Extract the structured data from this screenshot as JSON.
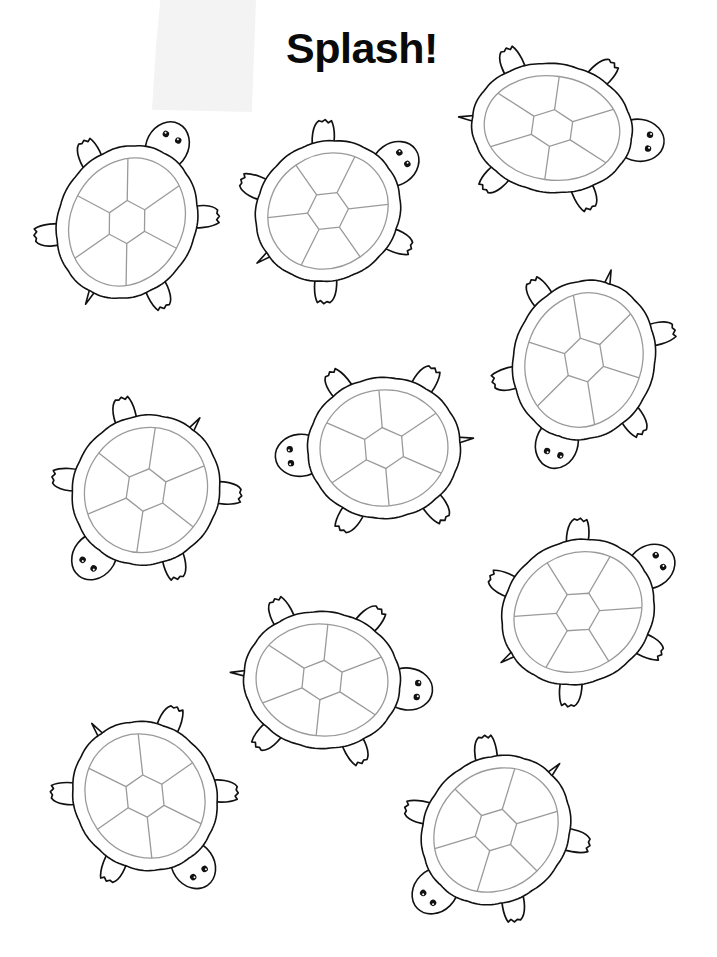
{
  "page": {
    "title": "Splash!",
    "background": "#ffffff",
    "line_color": "#111111",
    "scute_color": "#9a9a9a"
  },
  "illustration": {
    "subject": "turtle coloring page",
    "turtle_count": 10,
    "turtles": [
      {
        "id": 1,
        "cx": 127,
        "cy": 222,
        "rx": 60,
        "ry": 70,
        "heading": -62
      },
      {
        "id": 2,
        "cx": 328,
        "cy": 211,
        "rx": 60,
        "ry": 66,
        "heading": -35
      },
      {
        "id": 3,
        "cx": 552,
        "cy": 128,
        "rx": 72,
        "ry": 56,
        "heading": 8
      },
      {
        "id": 4,
        "cx": 584,
        "cy": 360,
        "rx": 62,
        "ry": 72,
        "heading": 108
      },
      {
        "id": 5,
        "cx": 146,
        "cy": 490,
        "rx": 64,
        "ry": 68,
        "heading": 128
      },
      {
        "id": 6,
        "cx": 384,
        "cy": 448,
        "rx": 68,
        "ry": 62,
        "heading": 175
      },
      {
        "id": 7,
        "cx": 578,
        "cy": 612,
        "rx": 62,
        "ry": 70,
        "heading": -32
      },
      {
        "id": 8,
        "cx": 322,
        "cy": 680,
        "rx": 70,
        "ry": 60,
        "heading": 6
      },
      {
        "id": 9,
        "cx": 145,
        "cy": 796,
        "rx": 62,
        "ry": 68,
        "heading": 55
      },
      {
        "id": 10,
        "cx": 496,
        "cy": 830,
        "rx": 62,
        "ry": 70,
        "heading": 135
      }
    ]
  }
}
